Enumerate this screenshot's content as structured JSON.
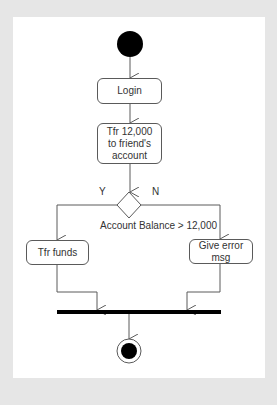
{
  "diagram": {
    "type": "uml-activity",
    "colors": {
      "background": "#e6e6e6",
      "panel": "#ffffff",
      "stroke": "#5a5a5a",
      "node_fill": "#000000",
      "text": "#333333"
    },
    "nodes": {
      "start": {
        "kind": "initial-node"
      },
      "login": {
        "kind": "action",
        "label": "Login"
      },
      "transfer": {
        "kind": "action",
        "label": "Tfr 12,000\nto friend's\naccount"
      },
      "decision": {
        "kind": "decision",
        "condition": "Account Balance > 12,000"
      },
      "transfer_funds": {
        "kind": "action",
        "label": "Tfr funds"
      },
      "error": {
        "kind": "action",
        "label": "Give error\nmsg"
      },
      "join": {
        "kind": "join-bar"
      },
      "end": {
        "kind": "final-node"
      }
    },
    "branch_labels": {
      "yes": "Y",
      "no": "N"
    },
    "edges": [
      {
        "from": "start",
        "to": "login"
      },
      {
        "from": "login",
        "to": "transfer"
      },
      {
        "from": "transfer",
        "to": "decision"
      },
      {
        "from": "decision",
        "to": "transfer_funds",
        "guard": "Y"
      },
      {
        "from": "decision",
        "to": "error",
        "guard": "N"
      },
      {
        "from": "transfer_funds",
        "to": "join"
      },
      {
        "from": "error",
        "to": "join"
      },
      {
        "from": "join",
        "to": "end"
      }
    ]
  }
}
